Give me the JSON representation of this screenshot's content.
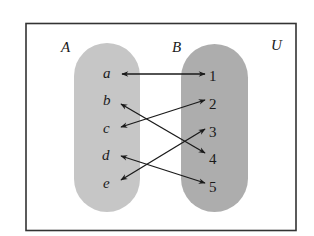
{
  "universe": {
    "label": "U",
    "border_color": "#333333",
    "background": "#ffffff"
  },
  "sets": [
    {
      "id": "A",
      "label": "A",
      "fill": "#c6c6c6",
      "elements": [
        "a",
        "b",
        "c",
        "d",
        "e"
      ]
    },
    {
      "id": "B",
      "label": "B",
      "fill": "#adadad",
      "elements": [
        "1",
        "2",
        "3",
        "4",
        "5"
      ]
    }
  ],
  "mappings": [
    {
      "from": "a",
      "to": "1",
      "bidirectional": true
    },
    {
      "from": "b",
      "to": "4",
      "bidirectional": true
    },
    {
      "from": "c",
      "to": "2",
      "bidirectional": true
    },
    {
      "from": "d",
      "to": "5",
      "bidirectional": true
    },
    {
      "from": "e",
      "to": "3",
      "bidirectional": true
    }
  ],
  "arrow_color": "#1a1a1a"
}
